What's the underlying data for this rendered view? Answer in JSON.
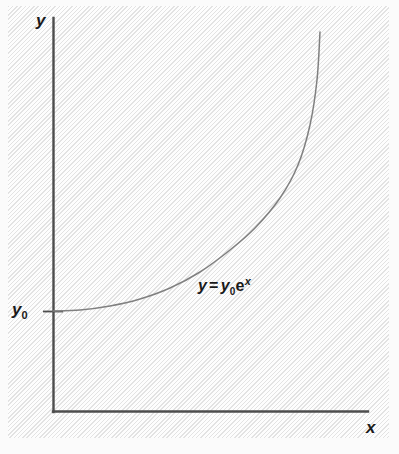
{
  "figure": {
    "background_color": "#f2f2f2",
    "axis_color": "#4d4d4d",
    "curve_color": "#808080",
    "text_color": "#1a1a1a"
  },
  "labels": {
    "y_axis": "y",
    "x_axis": "x",
    "y_intercept": "y",
    "y_intercept_subscript": "0",
    "equation": {
      "lhs": "y",
      "equals": "=",
      "coefficient": "y",
      "coefficient_subscript": "0",
      "base": "e",
      "exponent": "x",
      "full_text": "y = y0e^x"
    }
  },
  "chart_data": {
    "type": "line",
    "title": "",
    "subtitle": "",
    "xlabel": "x",
    "ylabel": "y",
    "legend": [],
    "legend_position": "none",
    "grid": false,
    "annotations": [
      {
        "text": "y = y0e^x",
        "x_px": 198,
        "y_px": 276
      },
      {
        "text": "y0",
        "x_px": 12,
        "y_px": 301,
        "role": "y-intercept tick label"
      }
    ],
    "axis_ranges": {
      "xlim": [
        0,
        1
      ],
      "ylim": [
        0,
        1
      ]
    },
    "tick_labels": {
      "x": [],
      "y": [
        "y0"
      ]
    },
    "series": [
      {
        "name": "y = y0e^x",
        "function": "y = y0 * exp(x)",
        "points_px": [
          [
            53,
            311
          ],
          [
            80,
            310
          ],
          [
            110,
            306
          ],
          [
            140,
            299
          ],
          [
            170,
            288
          ],
          [
            200,
            272
          ],
          [
            230,
            250
          ],
          [
            255,
            228
          ],
          [
            280,
            198
          ],
          [
            298,
            165
          ],
          [
            310,
            125
          ],
          [
            317,
            80
          ],
          [
            320,
            32
          ]
        ],
        "normalized": {
          "x": [
            0,
            0.1,
            0.2,
            0.3,
            0.4,
            0.5,
            0.6,
            0.7,
            0.8,
            0.88,
            0.94,
            0.98,
            1.0
          ],
          "y": [
            0.04,
            0.05,
            0.07,
            0.11,
            0.15,
            0.22,
            0.29,
            0.37,
            0.48,
            0.59,
            0.71,
            0.84,
            0.97
          ]
        }
      }
    ]
  }
}
